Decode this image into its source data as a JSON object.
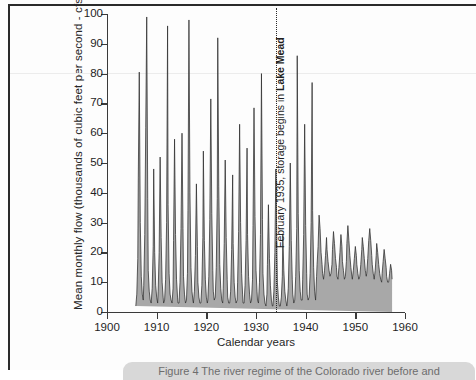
{
  "figure": {
    "caption": "Figure 4  The river regime of the Colorado river before and"
  },
  "chart_data": {
    "type": "area",
    "title": "",
    "xlabel": "Calendar years",
    "ylabel": "Mean monthly flow (thousands of cubic feet per second - cfs)",
    "xlim": [
      1900,
      1960
    ],
    "ylim": [
      0,
      100
    ],
    "xticks": [
      1900,
      1910,
      1920,
      1930,
      1940,
      1950,
      1960
    ],
    "yticks": [
      0,
      10,
      20,
      30,
      40,
      50,
      60,
      70,
      80,
      90,
      100
    ],
    "grid": false,
    "legend": "none",
    "fill_color": "#a8a8a8",
    "line_color": "#2e2e2e",
    "data_start_year": 1905.8,
    "data_end_year": 1957.4,
    "annotations": [
      {
        "name": "lake-mead-storage",
        "text_plain": "February 1935, storage begins in Lake Mead",
        "text_prefix": "February 1935, storage begins in ",
        "text_bold": "Lake Mead",
        "x_year": 1934.1,
        "orientation": "vertical",
        "line_style": "dotted"
      }
    ],
    "series": [
      {
        "name": "Mean monthly flow",
        "units": "thousands of cfs",
        "x": [
          1905.8,
          1906.0,
          1906.2,
          1906.3,
          1906.5,
          1906.7,
          1906.9,
          1907.1,
          1907.3,
          1907.4,
          1907.6,
          1907.8,
          1908.0,
          1908.2,
          1908.3,
          1908.5,
          1908.7,
          1908.9,
          1909.1,
          1909.3,
          1909.4,
          1909.6,
          1909.8,
          1910.0,
          1910.2,
          1910.3,
          1910.5,
          1910.7,
          1910.9,
          1911.1,
          1911.3,
          1911.4,
          1911.6,
          1911.8,
          1912.0,
          1912.2,
          1912.3,
          1912.5,
          1912.7,
          1912.9,
          1913.1,
          1913.3,
          1913.4,
          1913.6,
          1913.8,
          1914.0,
          1914.2,
          1914.3,
          1914.5,
          1914.7,
          1914.9,
          1915.1,
          1915.3,
          1915.4,
          1915.6,
          1915.8,
          1916.0,
          1916.2,
          1916.3,
          1916.5,
          1916.7,
          1916.9,
          1917.1,
          1917.3,
          1917.4,
          1917.6,
          1917.8,
          1918.0,
          1918.2,
          1918.3,
          1918.5,
          1918.7,
          1918.9,
          1919.1,
          1919.3,
          1919.4,
          1919.6,
          1919.8,
          1920.0,
          1920.2,
          1920.3,
          1920.5,
          1920.7,
          1920.9,
          1921.1,
          1921.3,
          1921.4,
          1921.6,
          1921.8,
          1922.0,
          1922.2,
          1922.3,
          1922.5,
          1922.7,
          1922.9,
          1923.1,
          1923.3,
          1923.4,
          1923.6,
          1923.8,
          1924.0,
          1924.2,
          1924.3,
          1924.5,
          1924.7,
          1924.9,
          1925.1,
          1925.3,
          1925.4,
          1925.6,
          1925.8,
          1926.0,
          1926.2,
          1926.3,
          1926.5,
          1926.7,
          1926.9,
          1927.1,
          1927.3,
          1927.4,
          1927.6,
          1927.8,
          1928.0,
          1928.2,
          1928.3,
          1928.5,
          1928.7,
          1928.9,
          1929.1,
          1929.3,
          1929.4,
          1929.6,
          1929.8,
          1930.0,
          1930.2,
          1930.3,
          1930.5,
          1930.7,
          1930.9,
          1931.1,
          1931.3,
          1931.4,
          1931.6,
          1931.8,
          1932.0,
          1932.2,
          1932.3,
          1932.5,
          1932.7,
          1932.9,
          1933.1,
          1933.3,
          1933.4,
          1933.6,
          1933.8,
          1934.0,
          1934.2,
          1934.3,
          1934.5,
          1934.7,
          1934.9,
          1935.1,
          1935.3,
          1935.4,
          1935.6,
          1935.8,
          1936.0,
          1936.2,
          1936.3,
          1936.5,
          1936.7,
          1936.9,
          1937.1,
          1937.3,
          1937.4,
          1937.6,
          1937.8,
          1938.0,
          1938.2,
          1938.3,
          1938.5,
          1938.7,
          1938.9,
          1939.1,
          1939.3,
          1939.4,
          1939.6,
          1939.8,
          1940.0,
          1940.2,
          1940.3,
          1940.5,
          1940.7,
          1940.9,
          1941.1,
          1941.3,
          1941.4,
          1941.6,
          1941.8,
          1942.0,
          1942.2,
          1942.3,
          1942.5,
          1942.7,
          1942.9,
          1943.1,
          1943.3,
          1943.4,
          1943.6,
          1943.8,
          1944.0,
          1944.2,
          1944.3,
          1944.5,
          1944.7,
          1944.9,
          1945.1,
          1945.3,
          1945.4,
          1945.6,
          1945.8,
          1946.0,
          1946.2,
          1946.3,
          1946.5,
          1946.7,
          1946.9,
          1947.1,
          1947.3,
          1947.4,
          1947.6,
          1947.8,
          1948.0,
          1948.2,
          1948.3,
          1948.5,
          1948.7,
          1948.9,
          1949.1,
          1949.3,
          1949.4,
          1949.6,
          1949.8,
          1950.0,
          1950.2,
          1950.3,
          1950.5,
          1950.7,
          1950.9,
          1951.1,
          1951.3,
          1951.4,
          1951.6,
          1951.8,
          1952.0,
          1952.2,
          1952.3,
          1952.5,
          1952.7,
          1952.9,
          1953.1,
          1953.3,
          1953.4,
          1953.6,
          1953.8,
          1954.0,
          1954.2,
          1954.3,
          1954.5,
          1954.7,
          1954.9,
          1955.1,
          1955.3,
          1955.4,
          1955.6,
          1955.8,
          1956.0,
          1956.2,
          1956.3,
          1956.5,
          1956.7,
          1956.9,
          1957.1,
          1957.3,
          1957.4
        ],
        "values": [
          2,
          6,
          18,
          45,
          80.5,
          30,
          12,
          6,
          4,
          9,
          26,
          62,
          99,
          38,
          14,
          7,
          4,
          3,
          8,
          22,
          48,
          20,
          9,
          5,
          3,
          7,
          20,
          52,
          25,
          10,
          5,
          3,
          4,
          11,
          30,
          96,
          36,
          13,
          6,
          4,
          3,
          8,
          24,
          58,
          26,
          11,
          5,
          3,
          3,
          10,
          28,
          60,
          28,
          12,
          6,
          3,
          4,
          13,
          34,
          98,
          40,
          15,
          7,
          4,
          3,
          7,
          19,
          43,
          22,
          10,
          5,
          3,
          3,
          9,
          25,
          54,
          24,
          11,
          5,
          3,
          4,
          12,
          31,
          71.5,
          33,
          14,
          7,
          4,
          5,
          15,
          38,
          92,
          42,
          16,
          8,
          4,
          3,
          8,
          23,
          51,
          25,
          11,
          5,
          3,
          3,
          7,
          21,
          46,
          23,
          10,
          5,
          3,
          4,
          10,
          27,
          63,
          30,
          13,
          6,
          3,
          3,
          9,
          24,
          55,
          26,
          12,
          6,
          3,
          4,
          11,
          29,
          68.5,
          32,
          14,
          7,
          4,
          3,
          10,
          26,
          80,
          31,
          13,
          6,
          3,
          2,
          6,
          16,
          36,
          18,
          9,
          4,
          2,
          2,
          7,
          20,
          48,
          22,
          10,
          5,
          2,
          2,
          5,
          12,
          26,
          14,
          7,
          4,
          2,
          3,
          8,
          22,
          50,
          24,
          11,
          6,
          3,
          4,
          12,
          28,
          86,
          33,
          14,
          7,
          4,
          4,
          11,
          26,
          63,
          29,
          13,
          6,
          4,
          5,
          13,
          30,
          77,
          34,
          15,
          7,
          4,
          12,
          16,
          22,
          32.5,
          28,
          20,
          16,
          13,
          11,
          14,
          19,
          25,
          21,
          17,
          14,
          12,
          13,
          16,
          21,
          27,
          23,
          18,
          15,
          12,
          11,
          15,
          20,
          26,
          22,
          17,
          14,
          11,
          12,
          17,
          23,
          29,
          24,
          19,
          15,
          12,
          11,
          14,
          18,
          22,
          19,
          16,
          13,
          11,
          12,
          16,
          21,
          25,
          22,
          18,
          14,
          12,
          13,
          18,
          24,
          28,
          24,
          19,
          16,
          13,
          11,
          14,
          19,
          23,
          20,
          16,
          13,
          11,
          10,
          13,
          17,
          21,
          18,
          15,
          12,
          10,
          10,
          13,
          16,
          14,
          11
        ]
      }
    ]
  },
  "axes": {
    "y_tick_labels": [
      "100",
      "90",
      "80",
      "70",
      "60",
      "50",
      "40",
      "30",
      "20",
      "10",
      "0"
    ],
    "x_tick_labels": [
      "1900",
      "1910",
      "1920",
      "1930",
      "1940",
      "1950",
      "1960"
    ]
  }
}
